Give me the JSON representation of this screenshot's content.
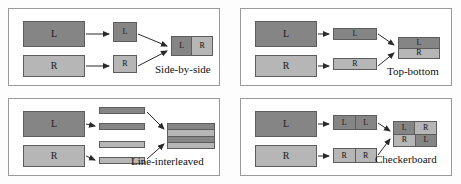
{
  "figure": {
    "colors": {
      "left_eye_fill": "#858585",
      "right_eye_fill": "#b6b6b6",
      "block_border": "#5d5d5d",
      "panel_border": "#9a9a9a",
      "background": "#fdfdfd",
      "text": "#111111"
    },
    "labels": {
      "left": "L",
      "right": "R"
    }
  },
  "panels": [
    {
      "id": "side-by-side",
      "caption": "Side-by-side",
      "source": {
        "left": "L",
        "right": "R"
      },
      "intermediate": {
        "left": "L",
        "right": "R"
      },
      "output": {
        "cells": [
          "L",
          "R"
        ],
        "arrangement": "1x2-horizontal"
      }
    },
    {
      "id": "top-bottom",
      "caption": "Top-bottom",
      "source": {
        "left": "L",
        "right": "R"
      },
      "intermediate": {
        "left": "L",
        "right": "R"
      },
      "output": {
        "cells": [
          "L",
          "R"
        ],
        "arrangement": "2x1-vertical"
      }
    },
    {
      "id": "line-interleaved",
      "caption": "Line-interleaved",
      "source": {
        "left": "L",
        "right": "R"
      },
      "intermediate": {
        "bars": [
          "L",
          "L",
          "R",
          "R"
        ]
      },
      "output": {
        "rows": [
          "L",
          "R",
          "L",
          "R"
        ],
        "arrangement": "4-row-interleave"
      }
    },
    {
      "id": "checkerboard",
      "caption": "Checkerboard",
      "source": {
        "left": "L",
        "right": "R"
      },
      "intermediate": {
        "left_pair": [
          "L",
          "L"
        ],
        "right_pair": [
          "R",
          "R"
        ]
      },
      "output": {
        "grid": [
          [
            "L",
            "R"
          ],
          [
            "R",
            "L"
          ]
        ],
        "arrangement": "2x2-checkerboard"
      }
    }
  ]
}
